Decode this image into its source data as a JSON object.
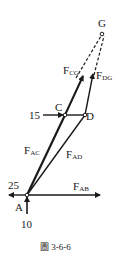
{
  "figure": {
    "caption": "圖 3-6-6",
    "colors": {
      "line": "#1a1a1a",
      "background": "#ffffff"
    },
    "points": {
      "A": {
        "label": "A",
        "x": 27,
        "y": 195
      },
      "C": {
        "label": "C",
        "x": 65,
        "y": 115
      },
      "D": {
        "label": "D",
        "x": 85,
        "y": 115
      },
      "G": {
        "label": "G",
        "x": 102,
        "y": 33
      }
    },
    "forces": {
      "FAC": {
        "main": "F",
        "sub": "AC"
      },
      "FAD": {
        "main": "F",
        "sub": "AD"
      },
      "FAB": {
        "main": "F",
        "sub": "AB"
      },
      "FCG": {
        "main": "F",
        "sub": "CG"
      },
      "FDG": {
        "main": "F",
        "sub": "DG"
      }
    },
    "loads": {
      "horizontal_at_A": "25",
      "vertical_at_A": "10",
      "horizontal_at_C": "15"
    }
  }
}
